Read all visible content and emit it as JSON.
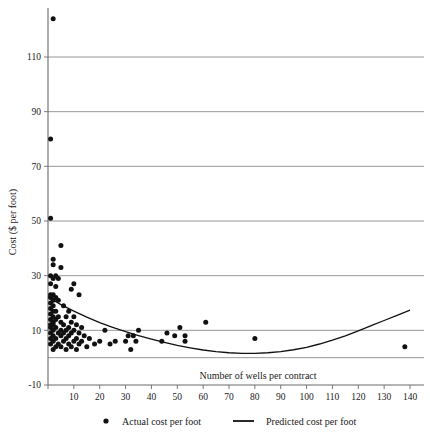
{
  "chart_data": {
    "type": "scatter",
    "title": "",
    "xlabel": "Number of wells per contract",
    "ylabel": "Cost ($ per foot)",
    "xlim": [
      0,
      140
    ],
    "ylim": [
      -10,
      124
    ],
    "xticks": [
      0,
      10,
      20,
      30,
      40,
      50,
      60,
      70,
      80,
      90,
      100,
      110,
      120,
      130,
      140
    ],
    "xtick_labels": [
      "",
      "10",
      "20",
      "30",
      "40",
      "50",
      "60",
      "70",
      "80",
      "90",
      "100",
      "110",
      "120",
      "130",
      "140"
    ],
    "yticks": [
      -10,
      10,
      30,
      50,
      70,
      90,
      110
    ],
    "ytick_labels": [
      "-10",
      "10",
      "30",
      "50",
      "70",
      "90",
      "110"
    ],
    "gridlines_y": [
      0,
      10,
      30,
      50,
      70,
      90,
      110
    ],
    "grid": "horizontal",
    "legend_position": "bottom",
    "marker_color": "#111111",
    "curve_color": "#111111",
    "grid_color": "#8c8c8c",
    "series": [
      {
        "name": "Actual cost per foot",
        "type": "scatter",
        "points": [
          [
            2,
            124
          ],
          [
            1,
            80
          ],
          [
            1,
            51
          ],
          [
            5,
            41
          ],
          [
            2,
            36
          ],
          [
            2,
            34
          ],
          [
            5,
            33
          ],
          [
            10,
            27
          ],
          [
            1,
            30
          ],
          [
            3,
            30
          ],
          [
            4,
            29
          ],
          [
            2,
            29
          ],
          [
            1,
            27
          ],
          [
            3,
            26
          ],
          [
            9,
            25
          ],
          [
            12,
            23
          ],
          [
            1,
            23
          ],
          [
            2,
            23
          ],
          [
            3,
            22
          ],
          [
            1,
            22
          ],
          [
            2,
            21
          ],
          [
            4,
            21
          ],
          [
            1,
            20
          ],
          [
            2,
            19
          ],
          [
            6,
            19
          ],
          [
            1,
            18
          ],
          [
            3,
            17
          ],
          [
            2,
            17
          ],
          [
            8,
            17
          ],
          [
            1,
            16
          ],
          [
            2,
            15
          ],
          [
            4,
            15
          ],
          [
            7,
            15
          ],
          [
            10,
            15
          ],
          [
            1,
            14
          ],
          [
            3,
            14
          ],
          [
            2,
            13
          ],
          [
            5,
            13
          ],
          [
            9,
            13
          ],
          [
            1,
            12
          ],
          [
            2,
            12
          ],
          [
            6,
            12
          ],
          [
            11,
            12
          ],
          [
            1,
            11
          ],
          [
            3,
            11
          ],
          [
            8,
            11
          ],
          [
            13,
            11
          ],
          [
            2,
            10
          ],
          [
            5,
            10
          ],
          [
            7,
            10
          ],
          [
            10,
            10
          ],
          [
            22,
            10
          ],
          [
            35,
            10
          ],
          [
            1,
            9
          ],
          [
            4,
            9
          ],
          [
            6,
            9
          ],
          [
            9,
            9
          ],
          [
            12,
            9
          ],
          [
            2,
            8
          ],
          [
            5,
            8
          ],
          [
            8,
            8
          ],
          [
            14,
            8
          ],
          [
            31,
            8
          ],
          [
            33,
            8
          ],
          [
            1,
            7
          ],
          [
            3,
            7
          ],
          [
            7,
            7
          ],
          [
            11,
            7
          ],
          [
            16,
            7
          ],
          [
            2,
            6
          ],
          [
            6,
            6
          ],
          [
            10,
            6
          ],
          [
            13,
            6
          ],
          [
            20,
            6
          ],
          [
            26,
            6
          ],
          [
            30,
            6
          ],
          [
            34,
            6
          ],
          [
            1,
            5
          ],
          [
            4,
            5
          ],
          [
            8,
            5
          ],
          [
            12,
            5
          ],
          [
            18,
            5
          ],
          [
            24,
            5
          ],
          [
            3,
            4
          ],
          [
            5,
            4
          ],
          [
            9,
            4
          ],
          [
            15,
            4
          ],
          [
            138,
            4
          ],
          [
            2,
            3
          ],
          [
            7,
            3
          ],
          [
            11,
            3
          ],
          [
            32,
            3
          ],
          [
            61,
            13
          ],
          [
            51,
            11
          ],
          [
            46,
            9
          ],
          [
            49,
            8
          ],
          [
            53,
            8
          ],
          [
            53,
            6
          ],
          [
            44,
            6
          ],
          [
            80,
            7
          ]
        ]
      },
      {
        "name": "Predicted cost per foot",
        "type": "line",
        "points": [
          [
            0,
            22.2
          ],
          [
            5,
            19.4
          ],
          [
            10,
            17.0
          ],
          [
            15,
            14.8
          ],
          [
            20,
            12.8
          ],
          [
            25,
            11.1
          ],
          [
            30,
            9.5
          ],
          [
            35,
            8.1
          ],
          [
            40,
            6.8
          ],
          [
            45,
            5.6
          ],
          [
            50,
            4.5
          ],
          [
            55,
            3.6
          ],
          [
            60,
            2.8
          ],
          [
            65,
            2.2
          ],
          [
            70,
            1.8
          ],
          [
            75,
            1.6
          ],
          [
            80,
            1.6
          ],
          [
            85,
            1.8
          ],
          [
            90,
            2.2
          ],
          [
            95,
            2.9
          ],
          [
            100,
            3.8
          ],
          [
            105,
            5.0
          ],
          [
            110,
            6.4
          ],
          [
            115,
            8.0
          ],
          [
            120,
            9.8
          ],
          [
            125,
            11.7
          ],
          [
            130,
            13.6
          ],
          [
            135,
            15.5
          ],
          [
            140,
            17.4
          ]
        ]
      }
    ]
  },
  "legend": {
    "items": [
      {
        "label": "Actual cost per foot",
        "marker": "dot"
      },
      {
        "label": "Predicted cost per foot",
        "marker": "line"
      }
    ]
  }
}
